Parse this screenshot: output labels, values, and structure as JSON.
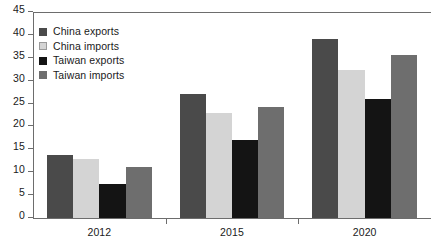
{
  "chart_data": {
    "type": "bar",
    "title": "",
    "xlabel": "",
    "ylabel": "",
    "categories": [
      "2012",
      "2015",
      "2020"
    ],
    "series": [
      {
        "name": "China exports",
        "color": "#4a4a4a",
        "values": [
          13.8,
          27.0,
          39.0
        ]
      },
      {
        "name": "China imports",
        "color": "#d4d4d4",
        "values": [
          13.0,
          23.0,
          32.3
        ]
      },
      {
        "name": "Taiwan exports",
        "color": "#141414",
        "values": [
          7.4,
          17.0,
          26.0
        ]
      },
      {
        "name": "Taiwan imports",
        "color": "#6e6e6e",
        "values": [
          11.2,
          24.3,
          35.7
        ]
      }
    ],
    "ylim": [
      0,
      45
    ],
    "ytick_step": 5,
    "yticks": [
      0,
      5,
      10,
      15,
      20,
      25,
      30,
      35,
      40,
      45
    ],
    "ytick_labels": [
      "0",
      "5",
      "10",
      "15",
      "20",
      "25",
      "30",
      "35",
      "40",
      "45"
    ],
    "grid": false,
    "legend_position": "upper-left-inside"
  },
  "legend": {
    "items": [
      {
        "label": "China exports",
        "swatch": "#4a4a4a"
      },
      {
        "label": "China imports",
        "swatch": "#d4d4d4"
      },
      {
        "label": "Taiwan exports",
        "swatch": "#141414"
      },
      {
        "label": "Taiwan imports",
        "swatch": "#6e6e6e"
      }
    ]
  },
  "caption": {
    "text": ""
  }
}
